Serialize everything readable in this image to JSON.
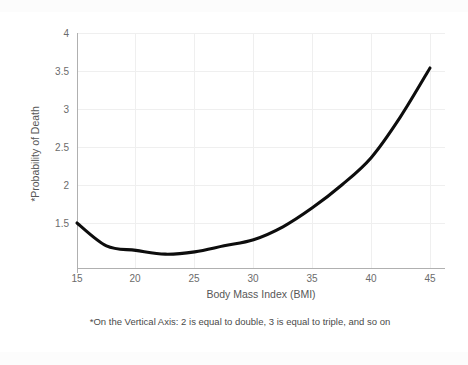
{
  "chart_data": {
    "type": "line",
    "title": "",
    "subtitle": "",
    "xlabel": "Body Mass Index (BMI)",
    "ylabel": "*Probability of Death",
    "xlim": [
      15,
      45
    ],
    "ylim": [
      1.0,
      4.0
    ],
    "xticks": [
      "15",
      "20",
      "25",
      "30",
      "35",
      "40",
      "45"
    ],
    "yticks": [
      "4",
      "3.5",
      "3",
      "2.5",
      "2",
      "1.5"
    ],
    "ytick_values": [
      4,
      3.5,
      3,
      2.5,
      2,
      1.5
    ],
    "xtick_values": [
      15,
      20,
      25,
      30,
      35,
      40,
      45
    ],
    "grid": true,
    "legend": "none",
    "annotation": "*On the Vertical Axis: 2 is equal to double, 3 is equal to triple, and so on",
    "line_color": "#0d0d0d",
    "grid_color": "#efefef",
    "axis_color": "#b0b0b0",
    "text_color": "#595959",
    "background_color": "#ffffff",
    "x": [
      15,
      17.5,
      20,
      22.5,
      25,
      27.5,
      30,
      32.5,
      35,
      37.5,
      40,
      42.5,
      45
    ],
    "series": [
      {
        "name": "Probability of Death",
        "values": [
          1.5,
          1.2,
          1.14,
          1.09,
          1.12,
          1.2,
          1.28,
          1.45,
          1.7,
          2.0,
          2.36,
          2.9,
          3.54
        ]
      }
    ]
  },
  "axes": {
    "y_title": "*Probability of Death",
    "x_title": "Body Mass Index (BMI)"
  },
  "footnote": {
    "text": "*On the Vertical Axis: 2 is equal to double, 3 is equal to triple, and so on"
  }
}
